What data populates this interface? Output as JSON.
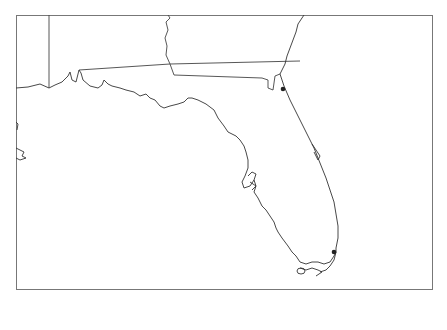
{
  "map": {
    "region": "Florida and neighboring Gulf Coast states",
    "frame": {
      "x": 16,
      "y": 15,
      "width": 417,
      "height": 275,
      "border_color": "#777777"
    },
    "line_color": "#333333",
    "background": "#ffffff",
    "markers": [
      {
        "name": "jacksonville-area-dot",
        "x": 283,
        "y": 89
      },
      {
        "name": "miami-area-dot",
        "x": 334,
        "y": 252
      }
    ]
  }
}
